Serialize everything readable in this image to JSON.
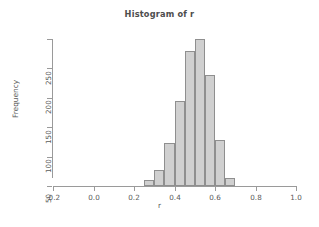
{
  "chart_data": {
    "type": "bar",
    "title": "Histogram of r",
    "xlabel": "r",
    "ylabel": "Frequency",
    "bin_width": 0.05,
    "bin_starts": [
      0.25,
      0.3,
      0.35,
      0.4,
      0.45,
      0.5,
      0.55,
      0.6,
      0.65
    ],
    "bin_ends": [
      0.3,
      0.35,
      0.4,
      0.45,
      0.5,
      0.55,
      0.6,
      0.65,
      0.7
    ],
    "categories": [
      "0.25-0.30",
      "0.30-0.35",
      "0.35-0.40",
      "0.40-0.45",
      "0.45-0.50",
      "0.50-0.55",
      "0.55-0.60",
      "0.60-0.65",
      "0.65-0.70"
    ],
    "values": [
      10,
      27,
      73,
      144,
      229,
      250,
      188,
      79,
      13
    ],
    "xlim": [
      -0.2,
      1.0
    ],
    "ylim": [
      0,
      250
    ],
    "xticks": [
      -0.2,
      0.0,
      0.2,
      0.4,
      0.6,
      0.8,
      1.0
    ],
    "xtick_labels": [
      "-0.2",
      "0.0",
      "0.2",
      "0.4",
      "0.6",
      "0.8",
      "1.0"
    ],
    "yticks": [
      0,
      50,
      100,
      150,
      200,
      250
    ],
    "ytick_labels": [
      "0",
      "50",
      "100",
      "150",
      "200",
      "250"
    ],
    "grid": false,
    "legend": "none",
    "bar_fill_color": "#d0d0d0",
    "bar_border_color": "#8f8f8f",
    "axis_color": "#9a9a9a",
    "text_color": "#5a5a5a",
    "background_color": "#ffffff"
  }
}
